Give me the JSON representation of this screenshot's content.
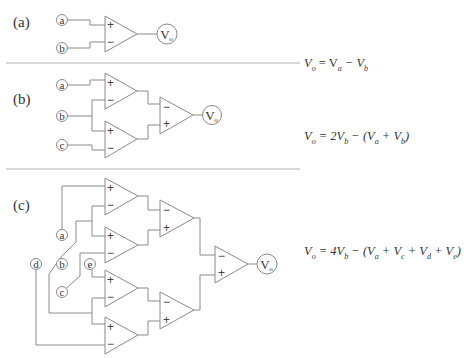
{
  "panels": [
    {
      "id": "a",
      "label": "(a)",
      "inputs": [
        "a",
        "b"
      ],
      "output": "Vo",
      "equation": "Vₒ = Vₐ − V_b",
      "equation_html_parts": [
        "V",
        "o",
        " = V",
        "a",
        " − V",
        "b"
      ]
    },
    {
      "id": "b",
      "label": "(b)",
      "inputs": [
        "a",
        "b",
        "c"
      ],
      "output": "Vo",
      "equation": "Vₒ = 2V_b − (Vₐ + V_b)"
    },
    {
      "id": "c",
      "label": "(c)",
      "inputs": [
        "a",
        "b",
        "c",
        "d",
        "e"
      ],
      "output": "Vo",
      "equation": "Vₒ = 4V_b − (Vₐ + V_c + V_d + V_e)"
    }
  ],
  "signs": {
    "plus": "+",
    "minus": "−"
  },
  "node_labels": {
    "a": "a",
    "b": "b",
    "c": "c",
    "d": "d",
    "e": "e",
    "out_main": "V",
    "out_sub": "o"
  },
  "equations": {
    "a": {
      "lhs": "V",
      "lhs_sub": "o",
      "rhs": "= V",
      "t1_sub": "a",
      "op": " − V",
      "t2_sub": "b"
    },
    "b": {
      "text": "= 2V",
      "p1": "b",
      "p2": " − (V",
      "p3": "a",
      "p4": " + V",
      "p5": "b",
      "p6": ")"
    },
    "c": {
      "text": "= 4V",
      "p1": "b",
      "p2": " − (V",
      "p3": "a",
      "p4": " + V",
      "p5": "c",
      "p6": " + V",
      "p7": "d",
      "p8": " + V",
      "p9": "e",
      "p10": ")"
    }
  }
}
